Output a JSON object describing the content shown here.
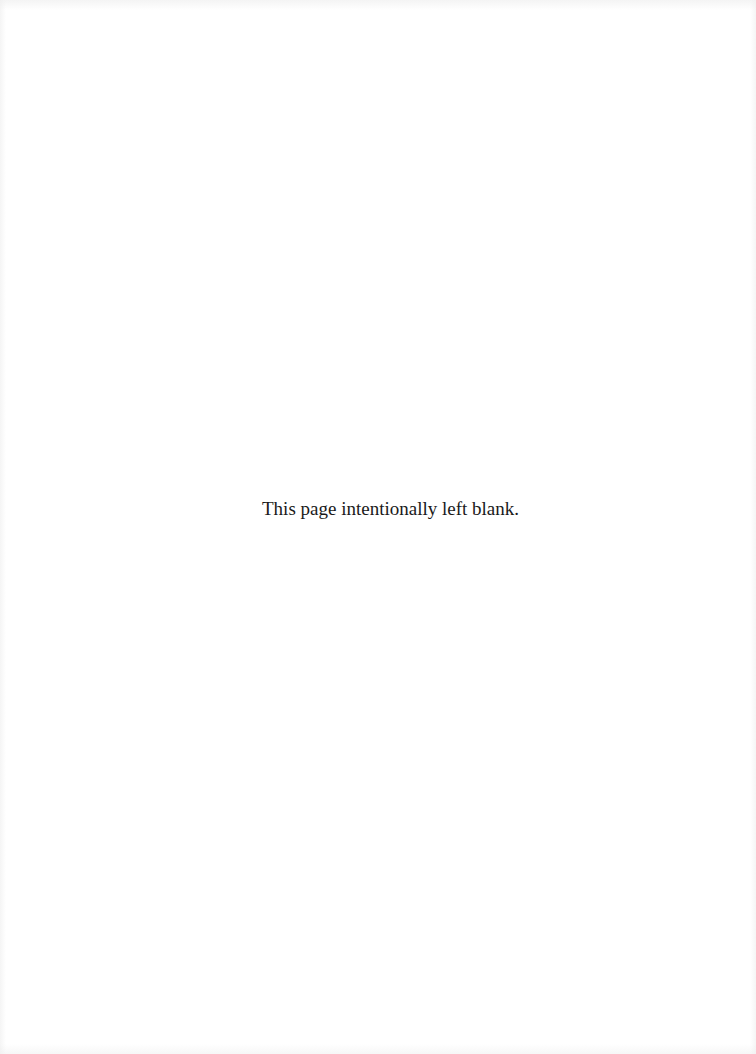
{
  "page": {
    "notice_text": "This page intentionally left blank.",
    "background_color": "#ffffff",
    "text_color": "#1a1a1a"
  }
}
